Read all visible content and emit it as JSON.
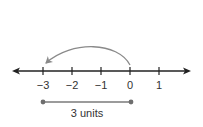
{
  "number_line": {
    "ticks": [
      {
        "value": -3,
        "label": "−3",
        "x": 43
      },
      {
        "value": -2,
        "label": "−2",
        "x": 72
      },
      {
        "value": -1,
        "label": "−1",
        "x": 101
      },
      {
        "value": 0,
        "label": "0",
        "x": 130
      },
      {
        "value": 1,
        "label": "1",
        "x": 159
      }
    ],
    "axis_color": "#222222",
    "has_left_arrow": true,
    "has_right_arrow": true
  },
  "jump_arrow": {
    "from": 0,
    "to": -3,
    "color": "#8a8a8a",
    "icon": "curved-arrow-left-icon"
  },
  "distance_segment": {
    "from": -3,
    "to": 0,
    "color": "#7a7a7a",
    "label": "3 units"
  }
}
